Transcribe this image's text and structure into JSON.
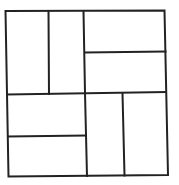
{
  "diagram": {
    "stroke_color": "#222222",
    "background_color": "#ffffff",
    "quadrants": [
      {
        "name": "top-left",
        "split": "vertical",
        "pieces": 2
      },
      {
        "name": "top-right",
        "split": "horizontal",
        "pieces": 2
      },
      {
        "name": "bottom-left",
        "split": "horizontal",
        "pieces": 2
      },
      {
        "name": "bottom-right",
        "split": "vertical",
        "pieces": 2
      }
    ]
  }
}
